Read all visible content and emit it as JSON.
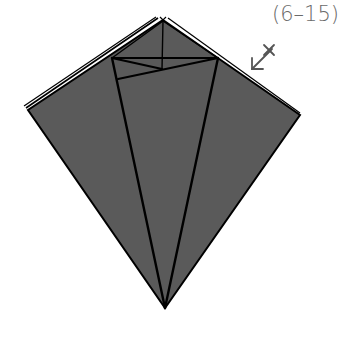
{
  "diagram": {
    "step_label": "(6–15)",
    "colors": {
      "paper_fill": "#5a5a5a",
      "crease_line": "#000000",
      "label": "#6a6a6a",
      "symbol": "#555555",
      "background": "#ffffff"
    },
    "shape": "kite",
    "outer_vertices": {
      "top": [
        163,
        20
      ],
      "left": [
        28,
        110
      ],
      "right": [
        300,
        115
      ],
      "bottom": [
        165,
        308
      ]
    },
    "inner_lines": [
      {
        "from": [
          112,
          58
        ],
        "to": [
          218,
          58
        ],
        "name": "upper-horizontal-crease"
      },
      {
        "from": [
          163,
          20
        ],
        "to": [
          162,
          69
        ],
        "name": "vertical-center-crease"
      },
      {
        "from": [
          112,
          58
        ],
        "to": [
          162,
          69
        ],
        "name": "left-diagonal-crease"
      },
      {
        "from": [
          218,
          58
        ],
        "to": [
          118,
          79
        ],
        "name": "long-diagonal-crease"
      },
      {
        "from": [
          112,
          58
        ],
        "to": [
          165,
          308
        ],
        "name": "left-long-crease"
      },
      {
        "from": [
          218,
          58
        ],
        "to": [
          165,
          308
        ],
        "name": "right-long-crease"
      }
    ],
    "symbols": [
      {
        "type": "fold-arrow-with-x",
        "position": [
          262,
          60
        ],
        "meaning": "fold behind / crease mark"
      }
    ]
  }
}
